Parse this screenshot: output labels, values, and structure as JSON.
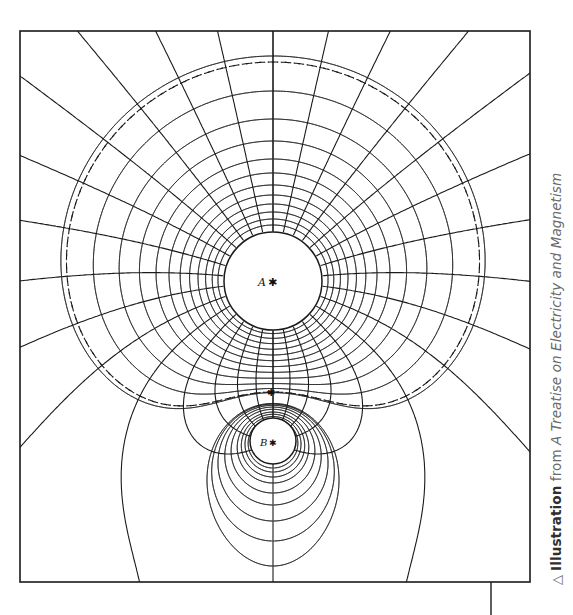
{
  "figure": {
    "charge_a_label": "A",
    "charge_b_label": "B",
    "singular_point_label": "P",
    "frame": {
      "x": 20,
      "y": 31,
      "w": 510,
      "h": 551
    },
    "charge_a": {
      "cx": 273,
      "cy": 281,
      "r": 49
    },
    "charge_b": {
      "cx": 273,
      "cy": 441,
      "r": 23
    },
    "line_color": "#1a1a1a"
  },
  "caption": {
    "icon": "triangle-up-outline-icon",
    "icon_glyph": "△",
    "label": "Illustration",
    "from": " from ",
    "title": "A Treatise on Electricity and Magnetism",
    "color": "#6a6a6a"
  }
}
